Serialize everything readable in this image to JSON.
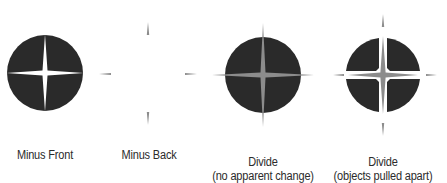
{
  "colors": {
    "background": "#ffffff",
    "shape_dark": "#2a2a2a",
    "star_gray": "#8c8c8c",
    "caption_text": "#2b2b2b"
  },
  "figures": [
    {
      "id": "minus-front",
      "caption_line1": "Minus Front",
      "caption_line2": ""
    },
    {
      "id": "minus-back",
      "caption_line1": "Minus Back",
      "caption_line2": ""
    },
    {
      "id": "divide-no-change",
      "caption_line1": "Divide",
      "caption_line2": "(no apparent change)"
    },
    {
      "id": "divide-pulled-apart",
      "caption_line1": "Divide",
      "caption_line2": "(objects pulled apart)"
    }
  ]
}
